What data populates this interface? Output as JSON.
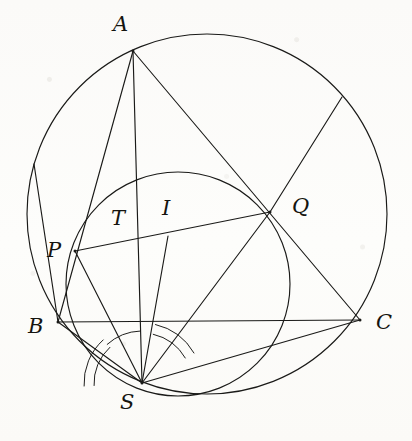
{
  "figure": {
    "background_color": "#fdfdfb",
    "ink_color": "#1a1a18",
    "stroke_width": 1.15,
    "width": 412,
    "height": 441
  },
  "points": {
    "A": {
      "label": "A",
      "x": 133,
      "y": 51,
      "label_x": 113,
      "label_y": 14
    },
    "B": {
      "label": "B",
      "x": 58,
      "y": 322,
      "label_x": 28,
      "label_y": 316
    },
    "C": {
      "label": "C",
      "x": 360,
      "y": 320,
      "label_x": 376,
      "label_y": 312
    },
    "P": {
      "label": "P",
      "x": 75,
      "y": 251,
      "label_x": 47,
      "label_y": 240
    },
    "Q": {
      "label": "Q",
      "x": 270,
      "y": 212,
      "label_x": 292,
      "label_y": 196
    },
    "S": {
      "label": "S",
      "x": 142,
      "y": 383,
      "label_x": 120,
      "label_y": 392
    },
    "T": {
      "label": "T",
      "x": 134,
      "y": 232,
      "label_x": 111,
      "label_y": 208
    },
    "I": {
      "label": "I",
      "x": 168,
      "y": 236,
      "label_x": 162,
      "label_y": 198
    }
  },
  "circles": [
    {
      "name": "circumcircle",
      "cx": 207,
      "cy": 214,
      "r": 180
    },
    {
      "name": "incircle",
      "cx": 178,
      "cy": 284,
      "r": 112
    }
  ],
  "segments": [
    {
      "name": "A-B",
      "from": "A",
      "to": "B"
    },
    {
      "name": "B-C",
      "from": "B",
      "to": "C"
    },
    {
      "name": "A-S",
      "from": "A",
      "to": "S"
    },
    {
      "name": "A-C",
      "from": "A",
      "to": "C"
    },
    {
      "name": "P-Q",
      "from": "P",
      "to": "Q"
    },
    {
      "name": "S-P",
      "from": "S",
      "to": "P"
    },
    {
      "name": "S-Q",
      "from": "S",
      "to": "Q"
    },
    {
      "name": "S-I",
      "from": "S",
      "to": "I"
    },
    {
      "name": "S-B",
      "from": "S",
      "to": "B"
    },
    {
      "name": "S-C",
      "from": "S",
      "to": "C"
    }
  ],
  "chords": [
    {
      "name": "chord-B-upper-left",
      "x1": 58,
      "y1": 322,
      "x2": 34,
      "y2": 164
    },
    {
      "name": "chord-Q-to-arc-NE",
      "x1": 270,
      "y1": 212,
      "x2": 342,
      "y2": 97
    }
  ],
  "angle_arcs": {
    "name": "equal-angle-marks-at-S",
    "vertex": "S",
    "marks": [
      {
        "name": "arc-BSP-outer",
        "radius": 58,
        "from_deg": 177,
        "to_deg": 228
      },
      {
        "name": "arc-BSP-inner",
        "radius": 48,
        "from_deg": 177,
        "to_deg": 228
      },
      {
        "name": "arc-PST",
        "radius": 52,
        "from_deg": 228,
        "to_deg": 268
      },
      {
        "name": "arc-ISQ-outer",
        "radius": 60,
        "from_deg": 283,
        "to_deg": 330
      },
      {
        "name": "arc-ISQ-inner",
        "radius": 50,
        "from_deg": 283,
        "to_deg": 330
      }
    ]
  },
  "labels_order": [
    "A",
    "Q",
    "T",
    "I",
    "P",
    "B",
    "C",
    "S"
  ]
}
